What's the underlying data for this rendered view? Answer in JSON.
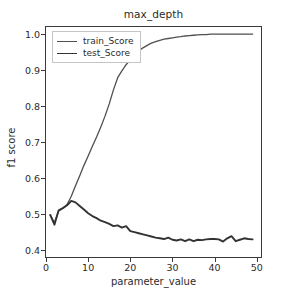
{
  "chart_data": {
    "type": "line",
    "title": "max_depth",
    "xlabel": "parameter_value",
    "ylabel": "f1 score",
    "xlim": [
      0,
      51
    ],
    "ylim": [
      0.38,
      1.02
    ],
    "xticks": [
      0,
      10,
      20,
      30,
      40,
      50
    ],
    "xtick_labels": [
      "0",
      "10",
      "20",
      "30",
      "40",
      "50"
    ],
    "yticks": [
      0.4,
      0.5,
      0.6,
      0.7,
      0.8,
      0.9,
      1.0
    ],
    "ytick_labels": [
      "0.4",
      "0.5",
      "0.6",
      "0.7",
      "0.8",
      "0.9",
      "1.0"
    ],
    "grid": false,
    "legend_position": "upper left",
    "x": [
      1,
      2,
      3,
      4,
      5,
      6,
      7,
      8,
      9,
      10,
      11,
      12,
      13,
      14,
      15,
      16,
      17,
      18,
      19,
      20,
      21,
      22,
      23,
      24,
      25,
      26,
      27,
      28,
      29,
      30,
      31,
      32,
      33,
      34,
      35,
      36,
      37,
      38,
      39,
      40,
      41,
      42,
      43,
      44,
      45,
      46,
      47,
      48,
      49
    ],
    "series": [
      {
        "name": "train_Score",
        "color": "#4f4f4f",
        "width": 1.3,
        "values": [
          0.497,
          0.476,
          0.508,
          0.516,
          0.526,
          0.549,
          0.578,
          0.606,
          0.635,
          0.661,
          0.688,
          0.714,
          0.742,
          0.772,
          0.806,
          0.845,
          0.879,
          0.898,
          0.915,
          0.929,
          0.943,
          0.953,
          0.962,
          0.969,
          0.975,
          0.979,
          0.983,
          0.986,
          0.988,
          0.99,
          0.992,
          0.993,
          0.995,
          0.996,
          0.997,
          0.998,
          0.999,
          0.999,
          1.0,
          1.0,
          1.0,
          1.0,
          1.0,
          1.0,
          1.0,
          1.0,
          1.0,
          1.0,
          1.0
        ]
      },
      {
        "name": "test_Score",
        "color": "#333333",
        "width": 1.9,
        "values": [
          0.497,
          0.47,
          0.51,
          0.516,
          0.524,
          0.536,
          0.532,
          0.522,
          0.512,
          0.502,
          0.494,
          0.488,
          0.481,
          0.477,
          0.472,
          0.466,
          0.468,
          0.462,
          0.466,
          0.452,
          0.449,
          0.446,
          0.443,
          0.44,
          0.437,
          0.434,
          0.432,
          0.43,
          0.434,
          0.428,
          0.426,
          0.429,
          0.424,
          0.429,
          0.424,
          0.428,
          0.427,
          0.429,
          0.43,
          0.43,
          0.429,
          0.423,
          0.432,
          0.438,
          0.424,
          0.428,
          0.432,
          0.43,
          0.429
        ]
      }
    ]
  },
  "legend": {
    "items": [
      {
        "label": "train_Score"
      },
      {
        "label": "test_Score"
      }
    ]
  }
}
